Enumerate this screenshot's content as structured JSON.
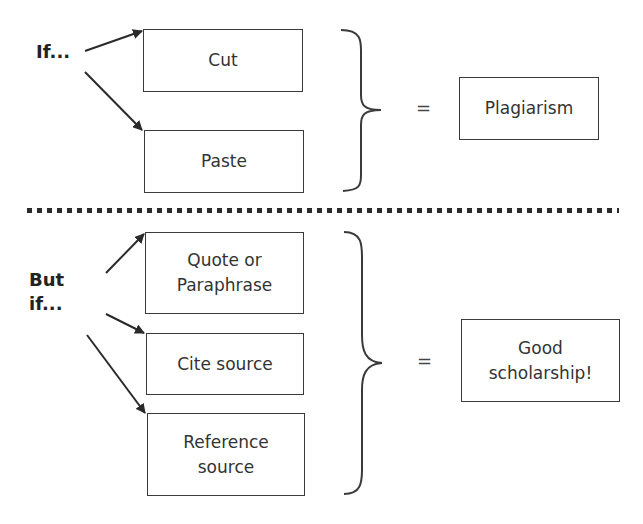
{
  "top": {
    "condition_label": "If...",
    "boxes": [
      {
        "text": "Cut"
      },
      {
        "text": "Paste"
      }
    ],
    "equals": "=",
    "result": "Plagiarism"
  },
  "bottom": {
    "condition_label_line1": "But",
    "condition_label_line2": "if...",
    "boxes": [
      {
        "line1": "Quote or",
        "line2": "Paraphrase"
      },
      {
        "text": "Cite source"
      },
      {
        "line1": "Reference",
        "line2": "source"
      }
    ],
    "equals": "=",
    "result_line1": "Good",
    "result_line2": "scholarship!"
  },
  "colors": {
    "stroke": "#3a3a3a",
    "text": "#333333",
    "background": "#ffffff"
  }
}
